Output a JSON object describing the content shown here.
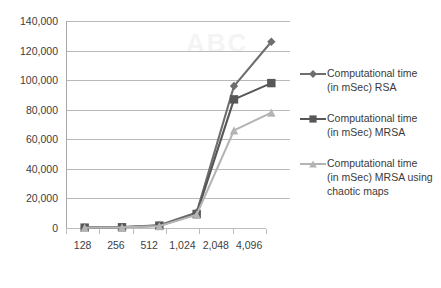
{
  "chart_data": {
    "type": "line",
    "title": "",
    "subtitle": "",
    "xlabel": "",
    "ylabel": "",
    "categories": [
      "128",
      "256",
      "512",
      "1,024",
      "2,048",
      "4,096"
    ],
    "ylim": [
      0,
      140000
    ],
    "ytick_values": [
      0,
      20000,
      40000,
      60000,
      80000,
      100000,
      120000,
      140000
    ],
    "ytick_labels": [
      "0",
      "20,000",
      "40,000",
      "60,000",
      "80,000",
      "100,000",
      "120,000",
      "140,000"
    ],
    "grid": true,
    "legend_position": "right",
    "series": [
      {
        "name": "Computational time (in mSec) RSA",
        "legend_label": "Computational time\n(in mSec) RSA",
        "marker": "diamond",
        "color": "#6e6e6e",
        "values": [
          300,
          600,
          1800,
          10500,
          96000,
          126000
        ]
      },
      {
        "name": "Computational time (in mSec) MRSA",
        "legend_label": "Computational time\n(in mSec) MRSA",
        "marker": "square",
        "color": "#575757",
        "values": [
          250,
          500,
          1600,
          9500,
          87000,
          98000
        ]
      },
      {
        "name": "Computational time (in mSec) MRSA using chaotic maps",
        "legend_label": "Computational time\n(in mSec) MRSA using\nchaotic maps",
        "marker": "triangle",
        "color": "#b4b4b4",
        "values": [
          200,
          400,
          1300,
          9000,
          66000,
          78000
        ]
      }
    ]
  },
  "axis": {
    "y_tick_labels": [
      "140,000",
      "120,000",
      "100,000",
      "80,000",
      "60,000",
      "40,000",
      "20,000",
      "0"
    ],
    "x_tick_labels": [
      "128",
      "256",
      "512",
      "1,024",
      "2,048",
      "4,096"
    ]
  },
  "legend": {
    "entries": [
      {
        "label": "Computational time\n(in mSec) RSA",
        "color": "#6e6e6e",
        "marker": "diamond"
      },
      {
        "label": "Computational time\n(in mSec) MRSA",
        "color": "#575757",
        "marker": "square"
      },
      {
        "label": "Computational time\n(in mSec) MRSA using\nchaotic maps",
        "color": "#b4b4b4",
        "marker": "triangle"
      }
    ]
  },
  "colors": {
    "series_rsa": "#6e6e6e",
    "series_mrsa": "#575757",
    "series_mrsa_chaotic": "#b4b4b4",
    "gridline": "#b9b9b9",
    "axis": "#a8a8a8",
    "background": "#ffffff",
    "text": "#3c3c3c"
  }
}
